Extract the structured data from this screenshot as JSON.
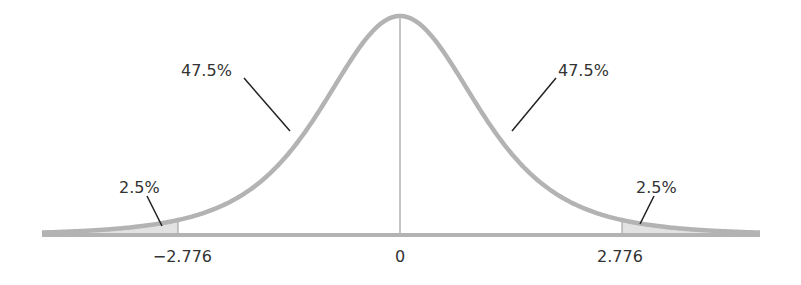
{
  "chart_data": {
    "type": "area",
    "title": "",
    "xlabel": "",
    "ylabel": "",
    "distribution": "t-distribution (df=4)",
    "df": 4,
    "xlim": [
      -4.5,
      4.5
    ],
    "tick_labels": [
      "−2.776",
      "0",
      "2.776"
    ],
    "ticks": [
      -2.776,
      0,
      2.776
    ],
    "regions": [
      {
        "name": "left tail",
        "from": -4.5,
        "to": -2.776,
        "percent": 2.5,
        "label": "2.5%",
        "shaded": true
      },
      {
        "name": "left center",
        "from": -2.776,
        "to": 0,
        "percent": 47.5,
        "label": "47.5%",
        "shaded": false
      },
      {
        "name": "right center",
        "from": 0,
        "to": 2.776,
        "percent": 47.5,
        "label": "47.5%",
        "shaded": false
      },
      {
        "name": "right tail",
        "from": 2.776,
        "to": 4.5,
        "percent": 2.5,
        "label": "2.5%",
        "shaded": true
      }
    ],
    "grid": false,
    "legend": null
  },
  "labels": {
    "left_tail": "2.5%",
    "left_center": "47.5%",
    "right_center": "47.5%",
    "right_tail": "2.5%",
    "tick_left": "−2.776",
    "tick_zero": "0",
    "tick_right": "2.776"
  },
  "colors": {
    "curve": "#b3b3b3",
    "tail_fill": "#e2e2e2",
    "axis": "#b3b3b3",
    "leader": "#222222",
    "text": "#333333"
  }
}
